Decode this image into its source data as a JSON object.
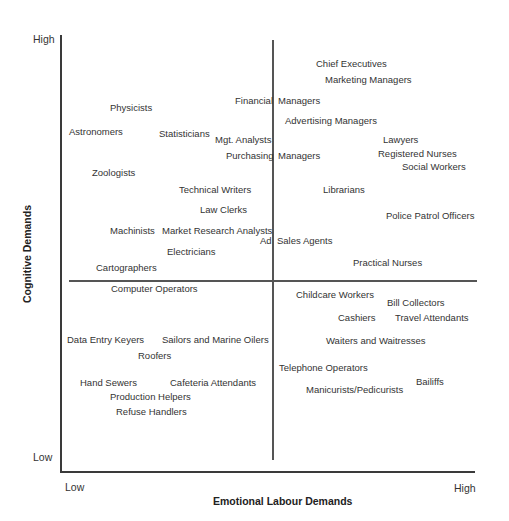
{
  "chart_data": {
    "type": "scatter",
    "title": "",
    "xlabel": "Emotional Labour Demands",
    "ylabel": "Cognitive Demands",
    "x_ticks": [
      "Low",
      "High"
    ],
    "y_ticks": [
      "High",
      "Low"
    ],
    "quadrant_dividers": true,
    "grid": false,
    "legend": "none",
    "points": [
      {
        "label": "Chief Executives",
        "x": 316,
        "y": 64
      },
      {
        "label": "Marketing Managers",
        "x": 325,
        "y": 80
      },
      {
        "label": "Physicists",
        "x": 110,
        "y": 108
      },
      {
        "label": "Financial",
        "x": 235,
        "y": 101
      },
      {
        "label": "Managers",
        "x": 278,
        "y": 101
      },
      {
        "label": "Advertising Managers",
        "x": 285,
        "y": 121
      },
      {
        "label": "Astronomers",
        "x": 69,
        "y": 132
      },
      {
        "label": "Statisticians",
        "x": 159,
        "y": 134
      },
      {
        "label": "Mgt. Analysts",
        "x": 215,
        "y": 140
      },
      {
        "label": "Lawyers",
        "x": 383,
        "y": 140
      },
      {
        "label": "Registered Nurses",
        "x": 378,
        "y": 154
      },
      {
        "label": "Purchasing",
        "x": 226,
        "y": 156
      },
      {
        "label": "Managers",
        "x": 278,
        "y": 156
      },
      {
        "label": "Social Workers",
        "x": 402,
        "y": 167
      },
      {
        "label": "Zoologists",
        "x": 92,
        "y": 173
      },
      {
        "label": "Technical Writers",
        "x": 179,
        "y": 190
      },
      {
        "label": "Librarians",
        "x": 323,
        "y": 190
      },
      {
        "label": "Law Clerks",
        "x": 200,
        "y": 210
      },
      {
        "label": "Police Patrol Officers",
        "x": 386,
        "y": 216
      },
      {
        "label": "Machinists",
        "x": 110,
        "y": 231
      },
      {
        "label": "Market Research Analysts",
        "x": 162,
        "y": 231
      },
      {
        "label": "Ad",
        "x": 260,
        "y": 241
      },
      {
        "label": "Sales Agents",
        "x": 277,
        "y": 241
      },
      {
        "label": "Electricians",
        "x": 167,
        "y": 252
      },
      {
        "label": "Practical Nurses",
        "x": 353,
        "y": 263
      },
      {
        "label": "Cartographers",
        "x": 96,
        "y": 268
      },
      {
        "label": "Computer Operators",
        "x": 111,
        "y": 289
      },
      {
        "label": "Childcare Workers",
        "x": 296,
        "y": 295
      },
      {
        "label": "Bill Collectors",
        "x": 387,
        "y": 303
      },
      {
        "label": "Cashiers",
        "x": 338,
        "y": 318
      },
      {
        "label": "Travel Attendants",
        "x": 395,
        "y": 318
      },
      {
        "label": "Data Entry Keyers",
        "x": 67,
        "y": 340
      },
      {
        "label": "Sailors and Marine Oilers",
        "x": 162,
        "y": 340
      },
      {
        "label": "Waiters and Waitresses",
        "x": 326,
        "y": 341
      },
      {
        "label": "Roofers",
        "x": 138,
        "y": 356
      },
      {
        "label": "Telephone Operators",
        "x": 279,
        "y": 368
      },
      {
        "label": "Hand Sewers",
        "x": 80,
        "y": 383
      },
      {
        "label": "Cafeteria Attendants",
        "x": 170,
        "y": 383
      },
      {
        "label": "Bailiffs",
        "x": 416,
        "y": 382
      },
      {
        "label": "Manicurists/Pedicurists",
        "x": 306,
        "y": 390
      },
      {
        "label": "Production Helpers",
        "x": 110,
        "y": 397
      },
      {
        "label": "Refuse Handlers",
        "x": 116,
        "y": 412
      }
    ]
  },
  "axes": {
    "y_high": "High",
    "y_low": "Low",
    "x_low": "Low",
    "x_high": "High",
    "x_title": "Emotional Labour Demands",
    "y_title": "Cognitive Demands"
  }
}
